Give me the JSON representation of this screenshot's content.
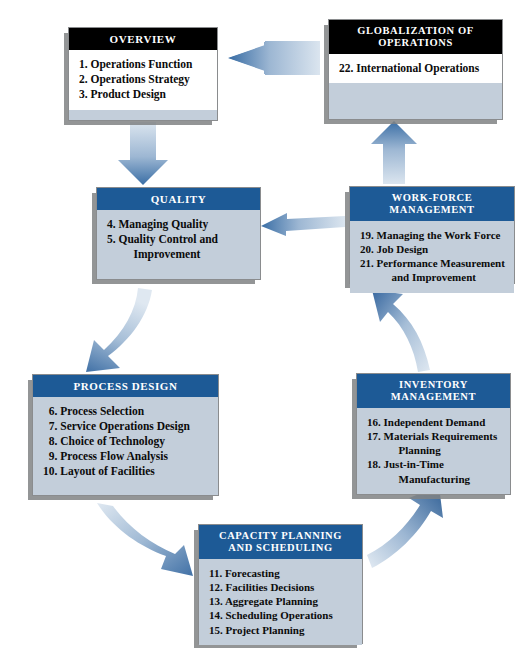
{
  "diagram": {
    "colors": {
      "header_dark": "#000000",
      "header_blue": "#1d5a96",
      "body_blue": "#c3ceda",
      "body_white": "#ffffff",
      "shadow_gray": "#808284",
      "arrow_dark": "#2e6096",
      "arrow_light": "#c9d7e6"
    },
    "boxes": [
      {
        "id": "overview",
        "title": "OVERVIEW",
        "style": "dark",
        "items": [
          "1. Operations Function",
          "2. Operations Strategy",
          "3. Product Design"
        ]
      },
      {
        "id": "globalization",
        "title": "GLOBALIZATION OF\nOPERATIONS",
        "title_lines": [
          "GLOBALIZATION OF",
          "OPERATIONS"
        ],
        "style": "dark",
        "items": [
          "22. International Operations"
        ]
      },
      {
        "id": "quality",
        "title": "QUALITY",
        "style": "blue",
        "items": [
          "4. Managing Quality",
          "5. Quality Control and\n    Improvement"
        ]
      },
      {
        "id": "workforce",
        "title": "WORK-FORCE\nMANAGEMENT",
        "title_lines": [
          "WORK-FORCE",
          "MANAGEMENT"
        ],
        "style": "blue",
        "items": [
          "19. Managing the Work Force",
          "20. Job Design",
          "21. Performance Measurement\n      and Improvement"
        ]
      },
      {
        "id": "process-design",
        "title": "PROCESS DESIGN",
        "style": "blue",
        "items": [
          "  6. Process Selection",
          "  7. Service Operations Design",
          "  8. Choice of Technology",
          "  9. Process Flow Analysis",
          "10. Layout of Facilities"
        ]
      },
      {
        "id": "inventory-management",
        "title": "INVENTORY MANAGEMENT",
        "style": "blue",
        "items": [
          "16. Independent Demand",
          "17. Materials Requirements\n      Planning",
          "18. Just-in-Time\n      Manufacturing"
        ]
      },
      {
        "id": "capacity-planning",
        "title": "CAPACITY PLANNING\nAND SCHEDULING",
        "title_lines": [
          "CAPACITY PLANNING",
          "AND SCHEDULING"
        ],
        "style": "blue",
        "items": [
          "11. Forecasting",
          "12. Facilities Decisions",
          "13. Aggregate Planning",
          "14. Scheduling Operations",
          "15. Project Planning"
        ]
      }
    ],
    "arrows": [
      {
        "id": "globalization-to-overview",
        "from": "globalization",
        "to": "overview",
        "shape": "straight",
        "direction": "left"
      },
      {
        "id": "overview-to-quality",
        "from": "overview",
        "to": "quality",
        "shape": "straight",
        "direction": "down"
      },
      {
        "id": "workforce-to-globalization",
        "from": "workforce",
        "to": "globalization",
        "shape": "straight",
        "direction": "up"
      },
      {
        "id": "workforce-to-quality",
        "from": "workforce",
        "to": "quality",
        "shape": "straight",
        "direction": "left"
      },
      {
        "id": "quality-to-process-design",
        "from": "quality",
        "to": "process-design",
        "shape": "curved",
        "direction": "down-left"
      },
      {
        "id": "inventory-to-workforce",
        "from": "inventory-management",
        "to": "workforce",
        "shape": "curved",
        "direction": "up-left"
      },
      {
        "id": "process-design-to-capacity",
        "from": "process-design",
        "to": "capacity-planning",
        "shape": "curved",
        "direction": "down-right"
      },
      {
        "id": "capacity-to-inventory",
        "from": "capacity-planning",
        "to": "inventory-management",
        "shape": "curved",
        "direction": "up-right"
      }
    ]
  }
}
